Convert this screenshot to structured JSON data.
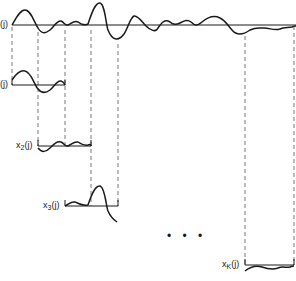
{
  "diagram": {
    "type": "signal-segmentation",
    "colors": {
      "ink": "#1a1a1a",
      "dash": "#555555",
      "background": "#ffffff"
    },
    "main_signal": {
      "label": "(j)",
      "baseline_y": 25
    },
    "segments": [
      {
        "label_main": "",
        "label_sub": "",
        "label_tail": "(j)",
        "x_start": 12,
        "x_end": 65,
        "baseline_y": 85
      },
      {
        "label_main": "x",
        "label_sub": "2",
        "label_tail": "(j)",
        "x_start": 38,
        "x_end": 91,
        "baseline_y": 146
      },
      {
        "label_main": "x",
        "label_sub": "3",
        "label_tail": "(j)",
        "x_start": 65,
        "x_end": 118,
        "baseline_y": 206
      },
      {
        "label_main": "x",
        "label_sub": "K",
        "label_tail": "(j)",
        "x_start": 245,
        "x_end": 294,
        "baseline_y": 265
      }
    ],
    "ellipsis": "• • •"
  }
}
